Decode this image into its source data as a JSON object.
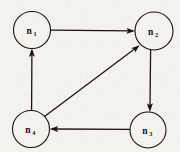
{
  "figure": {
    "type": "directed-graph",
    "background_color": "#f4f2ef",
    "ink_color": "#181512",
    "width": 180,
    "height": 152
  },
  "nodes": [
    {
      "id": "n1",
      "base": "n",
      "subscript": "1",
      "cx": 32,
      "cy": 30,
      "r": 18.5
    },
    {
      "id": "n2",
      "base": "n",
      "subscript": "2",
      "cx": 154,
      "cy": 31,
      "r": 19.0
    },
    {
      "id": "n3",
      "base": "n",
      "subscript": "3",
      "cx": 148,
      "cy": 130,
      "r": 18.0
    },
    {
      "id": "n4",
      "base": "n",
      "subscript": "4",
      "cx": 31,
      "cy": 129,
      "r": 18.5
    }
  ],
  "edges": [
    {
      "id": "e1",
      "from": "n1",
      "to": "n2",
      "label": "",
      "direction": "right",
      "shape": "straight"
    },
    {
      "id": "e2",
      "from": "n2",
      "to": "n3",
      "label": "",
      "direction": "down",
      "shape": "straight"
    },
    {
      "id": "e3",
      "from": "n3",
      "to": "n4",
      "label": "",
      "direction": "left",
      "shape": "straight"
    },
    {
      "id": "e4",
      "from": "n4",
      "to": "n1",
      "label": "",
      "direction": "up",
      "shape": "straight"
    },
    {
      "id": "e5",
      "from": "n4",
      "to": "n2",
      "label": "",
      "direction": "diagonal-up-right",
      "shape": "straight"
    }
  ]
}
